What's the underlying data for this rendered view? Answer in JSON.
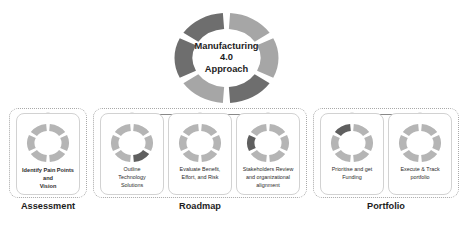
{
  "hub": {
    "title_lines": "Manufacturing\n4.0\nApproach",
    "segments": 6,
    "light_color": "#a6a6a6",
    "dark_color": "#6e6e6e",
    "segment_shades": [
      "light",
      "light",
      "dark",
      "light",
      "dark",
      "dark"
    ]
  },
  "colors": {
    "ring_light": "#b5b5b5",
    "ring_dark": "#5f5f5f",
    "card_border": "#d2d2d2",
    "group_border": "#a9a9a9",
    "rail_line": "#6b6b6b",
    "rail_dot": "#1a1a1a",
    "text": "#2b2b2b",
    "heading": "#1d1d1d"
  },
  "groups": [
    {
      "id": "assessment",
      "label": "Assessment",
      "card_ids": [
        "identify-pain-points"
      ]
    },
    {
      "id": "roadmap",
      "label": "Roadmap",
      "card_ids": [
        "outline-technology",
        "evaluate-benefit",
        "stakeholders-review"
      ]
    },
    {
      "id": "portfolio",
      "label": "Portfolio",
      "card_ids": [
        "prioritise-funding",
        "execute-track"
      ]
    }
  ],
  "cards": [
    {
      "id": "identify-pain-points",
      "text": "Identify Pain Points and\nVision",
      "bold": true,
      "highlight_index": -1
    },
    {
      "id": "outline-technology",
      "text": "Outline\nTechnology\nSolutions",
      "bold": false,
      "highlight_index": 2
    },
    {
      "id": "evaluate-benefit",
      "text": "Evaluate Benefit,\nEffort, and Risk",
      "bold": false,
      "highlight_index": -1
    },
    {
      "id": "stakeholders-review",
      "text": "Stakeholders Review\nand organizational\nalignment",
      "bold": false,
      "highlight_index": 4
    },
    {
      "id": "prioritise-funding",
      "text": "Prioritise and get\nFunding",
      "bold": false,
      "highlight_index": 5
    },
    {
      "id": "execute-track",
      "text": "Execute & Track\nportfolio",
      "bold": false,
      "highlight_index": -1
    }
  ]
}
